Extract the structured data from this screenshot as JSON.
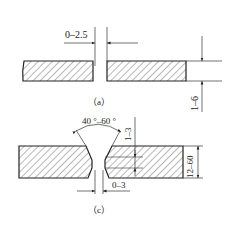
{
  "figure_a": {
    "caption": "（a）",
    "gap_dimension": "0–2.5",
    "thickness_dimension": "1–6"
  },
  "figure_c": {
    "caption": "（c）",
    "groove_angle": "40 °–60 °",
    "root_face_dimension": "1–3",
    "thickness_dimension": "12–60",
    "root_gap_dimension": "0–3"
  },
  "colors": {
    "line": "#222222",
    "background": "#ffffff"
  }
}
